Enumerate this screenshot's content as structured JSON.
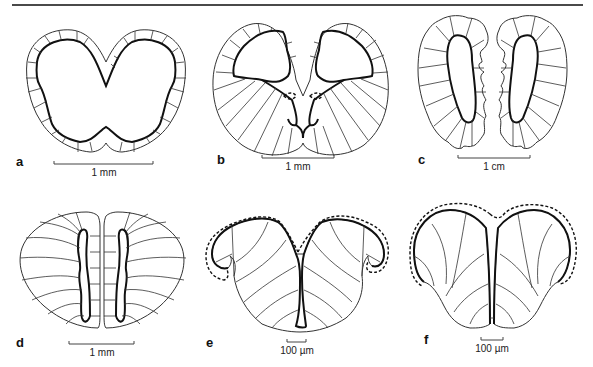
{
  "figure": {
    "panels": [
      {
        "id": "a",
        "label": "a",
        "scale_label": "1 mm"
      },
      {
        "id": "b",
        "label": "b",
        "scale_label": "1 mm"
      },
      {
        "id": "c",
        "label": "c",
        "scale_label": "1 cm"
      },
      {
        "id": "d",
        "label": "d",
        "scale_label": "1 mm"
      },
      {
        "id": "e",
        "label": "e",
        "scale_label": "100 µm"
      },
      {
        "id": "f",
        "label": "f",
        "scale_label": "100 µm"
      }
    ],
    "colors": {
      "line": "#111111",
      "background": "#ffffff",
      "rule": "#4a4a4a"
    }
  }
}
